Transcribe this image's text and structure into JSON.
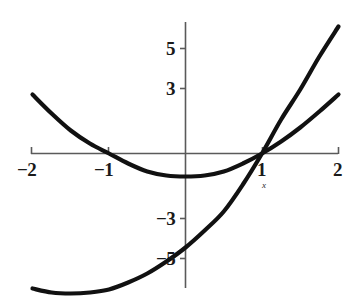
{
  "chart_data": {
    "type": "line",
    "title": "",
    "subtitle": "",
    "xlabel": "x",
    "ylabel": "",
    "grid": false,
    "legend": null,
    "xlim": [
      -2.15,
      2.15
    ],
    "ylim": [
      -7.6,
      6.9
    ],
    "x_ticks": [
      {
        "value": -2,
        "label": "−2"
      },
      {
        "value": -1,
        "label": "−1"
      },
      {
        "value": 1,
        "label": "1"
      },
      {
        "value": 2,
        "label": "2"
      }
    ],
    "y_ticks": [
      {
        "value": 5,
        "label": "5"
      },
      {
        "value": 3,
        "label": "3"
      },
      {
        "value": -3,
        "label": "−3"
      },
      {
        "value": -5,
        "label": "−5"
      }
    ],
    "annotations": [
      {
        "text": "x",
        "x": 1,
        "y": -1.15,
        "note": "axis variable name under the x = 1 tick"
      }
    ],
    "curve_color": "#111111",
    "axis_color": "#5a5a5a",
    "series": [
      {
        "name": "flat-parabola",
        "type": "line",
        "description": "shallow upward parabola with roots near x = -1 and x = 1, minimum about -1.15 at x = 0",
        "x": [
          -2.0,
          -1.75,
          -1.5,
          -1.25,
          -1.0,
          -0.75,
          -0.5,
          -0.25,
          0.0,
          0.25,
          0.5,
          0.75,
          1.0,
          1.25,
          1.5,
          1.75,
          2.0
        ],
        "y": [
          2.95,
          2.0,
          1.15,
          0.5,
          0.0,
          -0.5,
          -0.9,
          -1.1,
          -1.15,
          -1.1,
          -0.9,
          -0.5,
          0.0,
          0.6,
          1.3,
          2.1,
          2.95
        ]
      },
      {
        "name": "steep-parabola",
        "type": "line",
        "description": "steeper upward parabola passing through (1, 0), minimum about -6.85 near x = -1.1",
        "x": [
          -2.0,
          -1.75,
          -1.5,
          -1.25,
          -1.0,
          -0.75,
          -0.5,
          -0.25,
          0.0,
          0.25,
          0.5,
          0.75,
          1.0,
          1.25,
          1.5,
          1.75,
          2.0
        ],
        "y": [
          -6.75,
          -6.95,
          -7.0,
          -6.95,
          -6.8,
          -6.45,
          -6.0,
          -5.4,
          -4.7,
          -3.85,
          -2.9,
          -1.55,
          0.0,
          1.7,
          3.2,
          4.85,
          6.35
        ]
      }
    ]
  },
  "axes": {
    "origin_label": "",
    "x_axis_name": "x"
  }
}
